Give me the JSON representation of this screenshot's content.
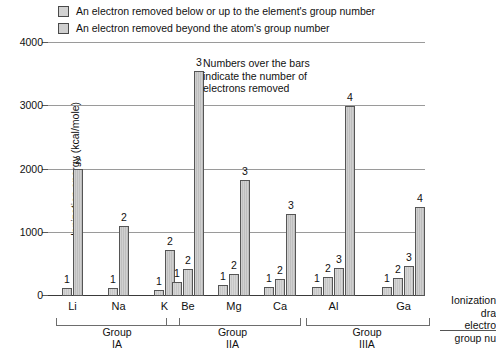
{
  "legend": {
    "items": [
      {
        "label": "An electron removed below or up to the element's group number",
        "swatch_color": "#d2d2d2",
        "key": "within"
      },
      {
        "label": "An electron removed beyond the atom's group number",
        "swatch_color": "#cfcfcf",
        "key": "beyond"
      }
    ]
  },
  "annotation": {
    "line1": "Numbers over the bars",
    "line2": "indicate the number of",
    "line3": "electrons removed"
  },
  "right_caption": {
    "line1": "Ionization",
    "line2": "dra",
    "line3": "electro",
    "line4": "group nu"
  },
  "axis": {
    "ylabel": "Ionization energy (kcal/mole)",
    "yticks": [
      "0",
      "1000",
      "2000",
      "3000",
      "4000"
    ],
    "ymin": 0,
    "ymax": 4000
  },
  "groups": [
    {
      "name": "Group",
      "roman": "IA"
    },
    {
      "name": "Group",
      "roman": "IIA"
    },
    {
      "name": "Group",
      "roman": "IIIA"
    }
  ],
  "chart_data": {
    "type": "bar",
    "title": "",
    "xlabel": "",
    "ylabel": "Ionization energy (kcal/mole)",
    "ylim": [
      0,
      4000
    ],
    "ytick_values": [
      0,
      1000,
      2000,
      3000,
      4000
    ],
    "grid": true,
    "legend_position": "top-left",
    "note": "Numbers over the bars indicate the number of electrons removed",
    "groups": [
      {
        "group_label": "Group IA",
        "elements": [
          {
            "symbol": "Li",
            "bars": [
              {
                "n": "1",
                "value": 125,
                "category": "within"
              },
              {
                "n": "2",
                "value": 2000,
                "category": "beyond"
              }
            ]
          },
          {
            "symbol": "Na",
            "bars": [
              {
                "n": "1",
                "value": 120,
                "category": "within"
              },
              {
                "n": "2",
                "value": 1100,
                "category": "beyond"
              }
            ]
          },
          {
            "symbol": "K",
            "bars": [
              {
                "n": "1",
                "value": 100,
                "category": "within"
              },
              {
                "n": "2",
                "value": 730,
                "category": "beyond"
              }
            ]
          }
        ]
      },
      {
        "group_label": "Group IIA",
        "elements": [
          {
            "symbol": "Be",
            "bars": [
              {
                "n": "1",
                "value": 215,
                "category": "within"
              },
              {
                "n": "2",
                "value": 420,
                "category": "within"
              },
              {
                "n": "3",
                "value": 3550,
                "category": "beyond"
              }
            ]
          },
          {
            "symbol": "Mg",
            "bars": [
              {
                "n": "1",
                "value": 175,
                "category": "within"
              },
              {
                "n": "2",
                "value": 345,
                "category": "within"
              },
              {
                "n": "3",
                "value": 1830,
                "category": "beyond"
              }
            ]
          },
          {
            "symbol": "Ca",
            "bars": [
              {
                "n": "1",
                "value": 140,
                "category": "within"
              },
              {
                "n": "2",
                "value": 275,
                "category": "within"
              },
              {
                "n": "3",
                "value": 1300,
                "category": "beyond"
              }
            ]
          }
        ]
      },
      {
        "group_label": "Group IIIA",
        "elements": [
          {
            "symbol": "Al",
            "bars": [
              {
                "n": "1",
                "value": 138,
                "category": "within"
              },
              {
                "n": "2",
                "value": 295,
                "category": "within"
              },
              {
                "n": "3",
                "value": 440,
                "category": "within"
              },
              {
                "n": "4",
                "value": 3000,
                "category": "beyond"
              }
            ]
          },
          {
            "symbol": "Ga",
            "bars": [
              {
                "n": "1",
                "value": 138,
                "category": "within"
              },
              {
                "n": "2",
                "value": 290,
                "category": "within"
              },
              {
                "n": "3",
                "value": 470,
                "category": "within"
              },
              {
                "n": "4",
                "value": 1400,
                "category": "beyond"
              }
            ]
          }
        ]
      }
    ]
  }
}
